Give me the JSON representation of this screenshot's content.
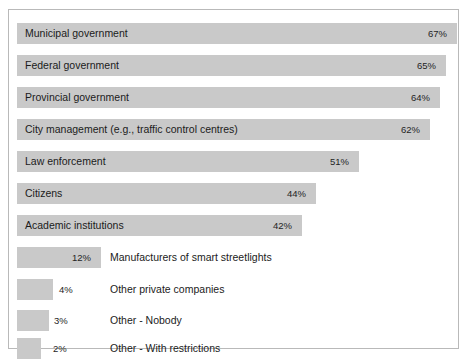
{
  "chart_data": {
    "type": "bar",
    "orientation": "horizontal",
    "title": "",
    "xlabel": "",
    "ylabel": "",
    "xlim": [
      0,
      70
    ],
    "grid": false,
    "legend": null,
    "bar_color": "#c9c9c9",
    "frame_color": "#b9b9b9",
    "background": "#ffffff",
    "categories": [
      "Municipal government",
      "Federal government",
      "Provincial government",
      "City management (e.g., traffic control centres)",
      "Law enforcement",
      "Citizens",
      "Academic institutions",
      "Manufacturers of smart streetlights",
      "Other private companies",
      "Other - Nobody",
      "Other - With restrictions"
    ],
    "values": [
      67,
      65,
      64,
      62,
      51,
      44,
      42,
      12,
      4,
      3,
      2
    ],
    "value_labels": [
      "67%",
      "65%",
      "64%",
      "62%",
      "51%",
      "44%",
      "42%",
      "12%",
      "4%",
      "3%",
      "2%"
    ]
  },
  "bars": [
    {
      "label": "Municipal government",
      "value": 67,
      "value_label": "67%",
      "bar_width_px": 440,
      "top_px": 13,
      "label_placement": "inside",
      "value_placement": "inside",
      "value_right_px": 10
    },
    {
      "label": "Federal government",
      "value": 65,
      "value_label": "65%",
      "bar_width_px": 429,
      "top_px": 45,
      "label_placement": "inside",
      "value_placement": "inside",
      "value_right_px": 10
    },
    {
      "label": "Provincial government",
      "value": 64,
      "value_label": "64%",
      "bar_width_px": 423,
      "top_px": 77,
      "label_placement": "inside",
      "value_placement": "inside",
      "value_right_px": 10
    },
    {
      "label": "City management (e.g., traffic control centres)",
      "value": 62,
      "value_label": "62%",
      "bar_width_px": 413,
      "top_px": 109,
      "label_placement": "inside",
      "value_placement": "inside",
      "value_right_px": 10
    },
    {
      "label": "Law enforcement",
      "value": 51,
      "value_label": "51%",
      "bar_width_px": 342,
      "top_px": 141,
      "label_placement": "inside",
      "value_placement": "inside",
      "value_right_px": 10
    },
    {
      "label": "Citizens",
      "value": 44,
      "value_label": "44%",
      "bar_width_px": 299,
      "top_px": 173,
      "label_placement": "inside",
      "value_placement": "inside",
      "value_right_px": 10
    },
    {
      "label": "Academic institutions",
      "value": 42,
      "value_label": "42%",
      "bar_width_px": 285,
      "top_px": 205,
      "label_placement": "inside",
      "value_placement": "inside",
      "value_right_px": 10
    },
    {
      "label": "Manufacturers of smart streetlights",
      "value": 12,
      "value_label": "12%",
      "bar_width_px": 84,
      "top_px": 237,
      "label_placement": "outside",
      "value_placement": "inside",
      "value_right_px": 10
    },
    {
      "label": "Other private companies",
      "value": 4,
      "value_label": "4%",
      "bar_width_px": 36,
      "top_px": 269,
      "label_placement": "outside",
      "value_placement": "outside",
      "value_left_px": 50
    },
    {
      "label": "Other - Nobody",
      "value": 3,
      "value_label": "3%",
      "bar_width_px": 32,
      "top_px": 300,
      "label_placement": "outside",
      "value_placement": "outside",
      "value_left_px": 45
    },
    {
      "label": "Other - With restrictions",
      "value": 2,
      "value_label": "2%",
      "bar_width_px": 24,
      "top_px": 328,
      "label_placement": "outside",
      "value_placement": "outside",
      "value_left_px": 44
    }
  ]
}
